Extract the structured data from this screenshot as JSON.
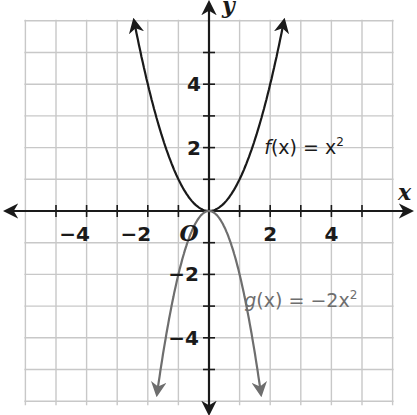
{
  "chart_data": {
    "type": "line",
    "title": "",
    "xlabel": "x",
    "ylabel": "y",
    "origin_label": "O",
    "xlim": [
      -6,
      6
    ],
    "ylim": [
      -6,
      6
    ],
    "grid": true,
    "x_ticks": [
      -4,
      -2,
      2,
      4
    ],
    "y_ticks": [
      4,
      2,
      -2,
      -4
    ],
    "x_tick_labels": [
      "−4",
      "−2",
      "2",
      "4"
    ],
    "y_tick_labels": [
      "4",
      "2",
      "−2",
      "−4"
    ],
    "series": [
      {
        "name": "f(x) = x²",
        "expression": "x^2",
        "color": "#1a1a1a",
        "x_range": [
          -2.45,
          2.45
        ],
        "points": [
          [
            -2,
            4
          ],
          [
            -1,
            1
          ],
          [
            0,
            0
          ],
          [
            1,
            1
          ],
          [
            2,
            4
          ]
        ],
        "label": {
          "text_fn": "f",
          "text_rest": "(x) = x",
          "sup": "2",
          "position": [
            2.0,
            2.0
          ]
        }
      },
      {
        "name": "g(x) = −2x²",
        "expression": "-2*x^2",
        "color": "#6e6e6e",
        "x_range": [
          -1.7,
          1.7
        ],
        "points": [
          [
            -1.5,
            -4.5
          ],
          [
            -1,
            -2
          ],
          [
            0,
            0
          ],
          [
            1,
            -2
          ],
          [
            1.5,
            -4.5
          ]
        ],
        "label": {
          "text_fn": "g",
          "text_rest": "(x) = −2x",
          "sup": "2",
          "position": [
            1.35,
            -2.85
          ]
        }
      }
    ],
    "legend": "inline annotations"
  },
  "colors": {
    "grid": "#c8c8c8",
    "axis": "#1a1a1a",
    "f_curve": "#1a1a1a",
    "g_curve": "#6e6e6e"
  }
}
